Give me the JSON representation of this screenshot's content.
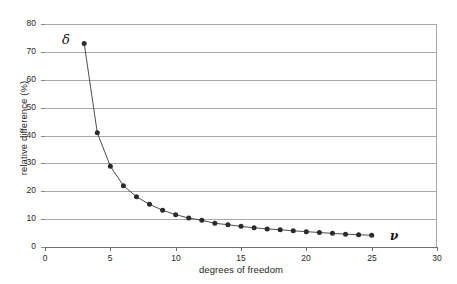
{
  "chart_data": {
    "type": "line",
    "title": "",
    "xlabel": "degrees of freedom",
    "ylabel": "relative difference (%)",
    "xlim": [
      0,
      30
    ],
    "ylim": [
      0,
      80
    ],
    "xticks": [
      0,
      5,
      10,
      15,
      20,
      25,
      30
    ],
    "yticks": [
      0,
      10,
      20,
      30,
      40,
      50,
      60,
      70,
      80
    ],
    "grid": "horizontal",
    "legend": "none",
    "marker": "filled-circle",
    "line_color": "#3a3a3a",
    "marker_color": "#2b2b2b",
    "grid_color": "#a8a8a8",
    "x": [
      3,
      4,
      5,
      6,
      7,
      8,
      9,
      10,
      11,
      12,
      13,
      14,
      15,
      16,
      17,
      18,
      19,
      20,
      21,
      22,
      23,
      24,
      25
    ],
    "values": [
      73.0,
      41.0,
      29.0,
      22.0,
      18.0,
      15.3,
      13.2,
      11.6,
      10.4,
      9.6,
      8.5,
      8.0,
      7.4,
      6.9,
      6.5,
      6.2,
      5.8,
      5.5,
      5.2,
      4.9,
      4.6,
      4.4,
      4.2
    ],
    "series": [
      {
        "name": "relative difference",
        "values": [
          73.0,
          41.0,
          29.0,
          22.0,
          18.0,
          15.3,
          13.2,
          11.6,
          10.4,
          9.6,
          8.5,
          8.0,
          7.4,
          6.9,
          6.5,
          6.2,
          5.8,
          5.5,
          5.2,
          4.9,
          4.6,
          4.4,
          4.2
        ]
      }
    ],
    "annotations": [
      {
        "name": "delta-symbol",
        "text": "δ",
        "x": 1.3,
        "y": 77.0
      },
      {
        "name": "nu-symbol",
        "text": "ν",
        "x": 26.4,
        "y": 6.5
      }
    ]
  }
}
